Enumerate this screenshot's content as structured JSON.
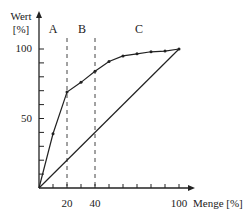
{
  "chart_data": {
    "type": "line",
    "title": "",
    "xlabel": "Menge [%]",
    "ylabel_line1": "Wert",
    "ylabel_line2": "[%]",
    "xlim": [
      0,
      100
    ],
    "ylim": [
      0,
      100
    ],
    "x_ticks_labeled": [
      20,
      40,
      100
    ],
    "x_tick_labels": [
      "20",
      "40",
      "100"
    ],
    "x_minor_step": 10,
    "y_ticks_labeled": [
      50,
      100
    ],
    "y_tick_labels": [
      "50",
      "100"
    ],
    "y_minor_step": 10,
    "grid": false,
    "regions": [
      {
        "label": "A",
        "from": 0,
        "to": 20
      },
      {
        "label": "B",
        "from": 20,
        "to": 40
      },
      {
        "label": "C",
        "from": 40,
        "to": 100
      }
    ],
    "boundaries": [
      20,
      40
    ],
    "series": [
      {
        "name": "ABC-Kurve",
        "markers": true,
        "x": [
          0,
          10,
          20,
          30,
          40,
          50,
          60,
          70,
          80,
          90,
          100
        ],
        "y": [
          0,
          39,
          69,
          76,
          84,
          91,
          95,
          96.5,
          98,
          98.5,
          100
        ]
      },
      {
        "name": "Gleichverteilung",
        "markers": false,
        "x": [
          0,
          100
        ],
        "y": [
          0,
          100
        ]
      }
    ]
  },
  "colors": {
    "line": "#222222",
    "axis": "#222222",
    "dash": "#444444",
    "background": "#ffffff"
  }
}
